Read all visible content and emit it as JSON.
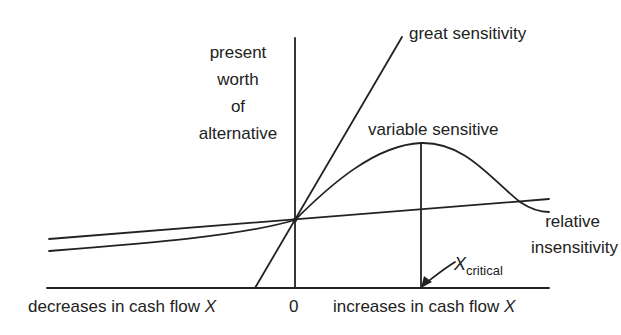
{
  "diagram": {
    "y_axis_label": [
      "present",
      "worth",
      "of",
      "alternative"
    ],
    "x_axis": {
      "left_label": "decreases in cash flow",
      "right_label": "increases in cash flow",
      "variable": "X",
      "origin": "0"
    },
    "curves": {
      "great": "great sensitivity",
      "variable": "variable sensitive",
      "relative_line1": "relative",
      "relative_line2": "insensitivity"
    },
    "critical": {
      "symbol": "X",
      "subscript": "critical"
    },
    "colors": {
      "ink": "#222222",
      "background": "#ffffff"
    }
  }
}
